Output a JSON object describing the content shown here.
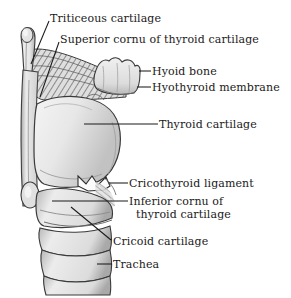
{
  "figure": {
    "background_color": "#ffffff",
    "ink_color": "#1a1a1a",
    "cartilage_fill": "#e9e9e9",
    "shadow_color": "#9a9a9a"
  },
  "labels": [
    {
      "id": "triticeous-cartilage",
      "text": "Triticeous cartilage",
      "x": 50,
      "y": 13
    },
    {
      "id": "superior-cornu",
      "text": "Superior cornu of thyroid cartilage",
      "x": 60,
      "y": 34
    },
    {
      "id": "hyoid-bone",
      "text": "Hyoid bone",
      "x": 152,
      "y": 66
    },
    {
      "id": "hyothyroid-membrane",
      "text": "Hyothyroid membrane",
      "x": 152,
      "y": 82
    },
    {
      "id": "thyroid-cartilage",
      "text": "Thyroid cartilage",
      "x": 159,
      "y": 119
    },
    {
      "id": "cricothyroid-ligament",
      "text": "Cricothyroid ligament",
      "x": 129,
      "y": 178
    },
    {
      "id": "inferior-cornu-line1",
      "text": "Inferior cornu of",
      "x": 129,
      "y": 196
    },
    {
      "id": "inferior-cornu-line2",
      "text": "thyroid cartilage",
      "x": 136,
      "y": 209
    },
    {
      "id": "cricoid-cartilage",
      "text": "Cricoid cartilage",
      "x": 113,
      "y": 236
    },
    {
      "id": "trachea",
      "text": "Trachea",
      "x": 113,
      "y": 259
    }
  ],
  "leader_lines": [
    {
      "id": "leader-triticeous",
      "x1": 49,
      "y1": 21,
      "x2": 31,
      "y2": 64
    },
    {
      "id": "leader-superior-cornu",
      "x1": 59,
      "y1": 42,
      "x2": 40,
      "y2": 97
    },
    {
      "id": "leader-hyoid-bone",
      "x1": 139,
      "y1": 71,
      "x2": 151,
      "y2": 71
    },
    {
      "id": "leader-hyothyroid-membrane",
      "x1": 139,
      "y1": 87,
      "x2": 151,
      "y2": 87
    },
    {
      "id": "leader-thyroid-cartilage",
      "x1": 118,
      "y1": 124,
      "x2": 158,
      "y2": 124
    },
    {
      "id": "leader-cricothyroid-ligament",
      "x1": 113,
      "y1": 183,
      "x2": 128,
      "y2": 183
    },
    {
      "id": "leader-inferior-cornu",
      "x1": 54,
      "y1": 201,
      "x2": 128,
      "y2": 201
    },
    {
      "id": "leader-cricoid-cartilage",
      "x1": 71,
      "y1": 207,
      "x2": 110,
      "y2": 241
    },
    {
      "id": "leader-trachea",
      "x1": 98,
      "y1": 264,
      "x2": 112,
      "y2": 264
    }
  ],
  "structures": [
    {
      "id": "triticeous-cartilage-nodule",
      "kind": "small-oval-nodule"
    },
    {
      "id": "superior-cornu-horn",
      "kind": "upward-horn"
    },
    {
      "id": "hyoid-bone-body",
      "kind": "lobed-bar"
    },
    {
      "id": "hyothyroid-membrane-sheet",
      "kind": "hatched-sheet"
    },
    {
      "id": "thyroid-cartilage-lamina",
      "kind": "large-rounded-plate"
    },
    {
      "id": "cricothyroid-ligament-notch",
      "kind": "zigzag-notch"
    },
    {
      "id": "inferior-cornu-nodule",
      "kind": "small-oval-nodule"
    },
    {
      "id": "cricoid-cartilage-ring",
      "kind": "ring-band"
    },
    {
      "id": "trachea-rings",
      "kind": "stacked-bands",
      "count": 3
    }
  ]
}
